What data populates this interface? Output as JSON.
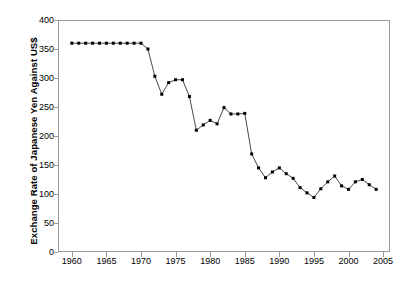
{
  "chart_data": {
    "type": "line",
    "title": "",
    "xlabel": "",
    "ylabel": "Exchange Rate of Japanese Yen Against US$",
    "xlim": [
      1958,
      2006
    ],
    "ylim": [
      0,
      400
    ],
    "grid": false,
    "legend": "none",
    "marker": "filled-square",
    "line_color": "#333333",
    "marker_color": "#000000",
    "frame_color": "#9a9a9a",
    "x_ticks": [
      1960,
      1965,
      1970,
      1975,
      1980,
      1985,
      1990,
      1995,
      2000,
      2005
    ],
    "x_tick_labels": [
      "1960",
      "1965",
      "1970",
      "1975",
      "1980",
      "1985",
      "1990",
      "1995",
      "2000",
      "2005"
    ],
    "y_ticks": [
      0,
      50,
      100,
      150,
      200,
      250,
      300,
      350,
      400
    ],
    "y_tick_labels": [
      "0",
      "50",
      "100",
      "150",
      "200",
      "250",
      "300",
      "350",
      "400"
    ],
    "x": [
      1960,
      1961,
      1962,
      1963,
      1964,
      1965,
      1966,
      1967,
      1968,
      1969,
      1970,
      1971,
      1972,
      1973,
      1974,
      1975,
      1976,
      1977,
      1978,
      1979,
      1980,
      1981,
      1982,
      1983,
      1984,
      1985,
      1986,
      1987,
      1988,
      1989,
      1990,
      1991,
      1992,
      1993,
      1994,
      1995,
      1996,
      1997,
      1998,
      1999,
      2000,
      2001,
      2002,
      2003,
      2004
    ],
    "values": [
      360,
      360,
      360,
      360,
      360,
      360,
      360,
      360,
      360,
      360,
      360,
      350,
      303,
      272,
      292,
      297,
      297,
      268,
      210,
      219,
      227,
      221,
      249,
      238,
      238,
      239,
      169,
      145,
      128,
      138,
      145,
      135,
      127,
      111,
      102,
      94,
      109,
      121,
      131,
      114,
      108,
      121,
      125,
      116,
      108
    ],
    "annotations": []
  },
  "axis": {
    "y_title": "Exchange Rate of Japanese Yen Against US$"
  }
}
